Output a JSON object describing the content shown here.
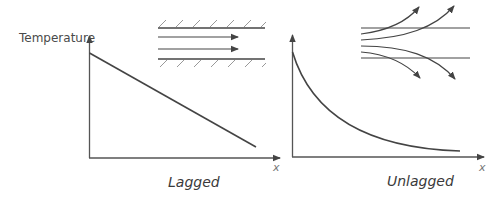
{
  "diagram": {
    "y_axis_label": "Temperature",
    "panels": [
      {
        "name": "lagged",
        "caption": "Lagged",
        "x_axis_label": "x",
        "curve": "linear decrease",
        "inset": "insulated pipe with straight parallel flow arrows"
      },
      {
        "name": "unlagged",
        "caption": "Unlagged",
        "x_axis_label": "x",
        "curve": "exponential decay",
        "inset": "uninsulated pipe with flow arrows diverging outward"
      }
    ]
  },
  "colors": {
    "line": "#444444",
    "hatch": "#999999",
    "text": "#4a4a4a"
  }
}
